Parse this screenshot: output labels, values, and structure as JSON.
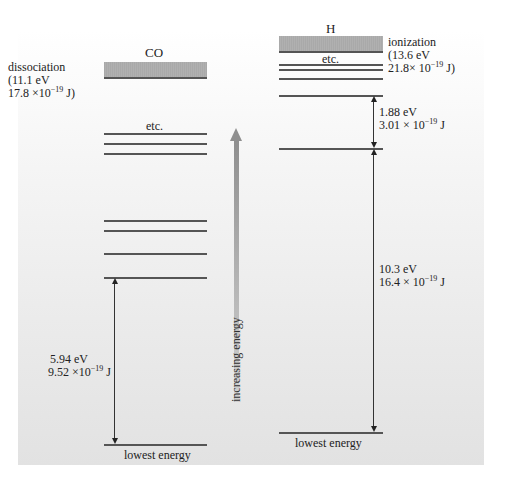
{
  "caption_top": "…every single one of these lines and the energy separations, and the molecule is ionized or dissociated.",
  "co": {
    "title": "CO",
    "dissociation": {
      "label": "dissociation",
      "energy_ev": "(11.1 eV",
      "energy_j_base": "17.8 ×10",
      "energy_j_exp": "−19",
      "energy_j_unit": " J)"
    },
    "etc": "etc.",
    "levels_y": [
      133,
      143,
      153,
      220,
      230,
      253,
      277
    ],
    "lowest_y": 444,
    "lowest_label": "lowest energy",
    "gap": {
      "ev": "5.94 eV",
      "j_base": "9.52 ×10",
      "j_exp": "−19",
      "j_unit": "  J"
    }
  },
  "axis": {
    "label": "increasing energy"
  },
  "h": {
    "title": "H",
    "ionization": {
      "label": "ionization",
      "energy_ev": "(13.6 eV",
      "energy_j_base": "21.8× 10",
      "energy_j_exp": "−19",
      "energy_j_unit": " J)"
    },
    "etc": "etc.",
    "levels_y": [
      64,
      69,
      78,
      95,
      148
    ],
    "lowest_y": 432,
    "lowest_label": "lowest energy",
    "gap_upper": {
      "ev": "1.88 eV",
      "j_base": "3.01 × 10",
      "j_exp": "−19",
      "j_unit": "  J"
    },
    "gap_lower": {
      "ev": "10.3 eV",
      "j_base": "16.4 × 10",
      "j_exp": "−19",
      "j_unit": "  J"
    }
  },
  "colors": {
    "band": "#a9a9a9",
    "line": "#555555",
    "arrow": "#8f8f8f",
    "bg_bottom": "#e2e2e2"
  }
}
